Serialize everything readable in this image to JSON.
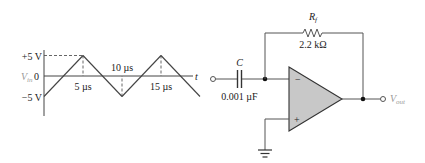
{
  "waveform": {
    "y_axis_label": "V",
    "y_axis_label_sub": "in",
    "x_axis_label": "t",
    "y_ticks": [
      {
        "label": "+5 V",
        "value": 5
      },
      {
        "label": "0",
        "value": 0
      },
      {
        "label": "−5 V",
        "value": -5
      }
    ],
    "time_labels": [
      {
        "label": "5 µs",
        "t": 5,
        "position": "below"
      },
      {
        "label": "10 µs",
        "t": 10,
        "position": "above"
      },
      {
        "label": "15 µs",
        "t": 15,
        "position": "below"
      }
    ],
    "shape": "triangle",
    "amplitude_v": 5,
    "period_us": 10,
    "points": [
      {
        "t": 0,
        "v": -5
      },
      {
        "t": 5,
        "v": 5
      },
      {
        "t": 10,
        "v": -5
      },
      {
        "t": 15,
        "v": 5
      },
      {
        "t": 20,
        "v": -5
      }
    ],
    "t_max": 20
  },
  "circuit": {
    "capacitor": {
      "name": "C",
      "value": "0.001 µF"
    },
    "resistor": {
      "name": "R",
      "name_sub": "f",
      "value": "2.2 kΩ"
    },
    "opamp": {
      "inverting": "−",
      "noninverting": "+"
    },
    "output": {
      "label": "V",
      "label_sub": "out"
    },
    "opamp_fill": "#c8c8c8"
  }
}
